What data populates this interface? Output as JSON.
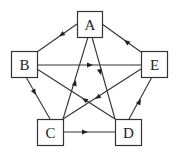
{
  "diagram": {
    "type": "directed-graph",
    "nodes": [
      {
        "id": "A",
        "label": "A",
        "x": 77,
        "y": 11,
        "w": 25,
        "h": 26
      },
      {
        "id": "B",
        "label": "B",
        "x": 11,
        "y": 51,
        "w": 26,
        "h": 26
      },
      {
        "id": "E",
        "label": "E",
        "x": 141,
        "y": 51,
        "w": 26,
        "h": 26
      },
      {
        "id": "C",
        "label": "C",
        "x": 37,
        "y": 119,
        "w": 26,
        "h": 26
      },
      {
        "id": "D",
        "label": "D",
        "x": 115,
        "y": 119,
        "w": 26,
        "h": 26
      }
    ],
    "edges": [
      {
        "from": "A",
        "to": "B"
      },
      {
        "from": "E",
        "to": "A"
      },
      {
        "from": "B",
        "to": "E"
      },
      {
        "from": "B",
        "to": "C"
      },
      {
        "from": "D",
        "to": "E"
      },
      {
        "from": "C",
        "to": "D"
      },
      {
        "from": "A",
        "to": "D"
      },
      {
        "from": "C",
        "to": "A"
      },
      {
        "from": "D",
        "to": "B"
      },
      {
        "from": "E",
        "to": "C"
      }
    ]
  }
}
